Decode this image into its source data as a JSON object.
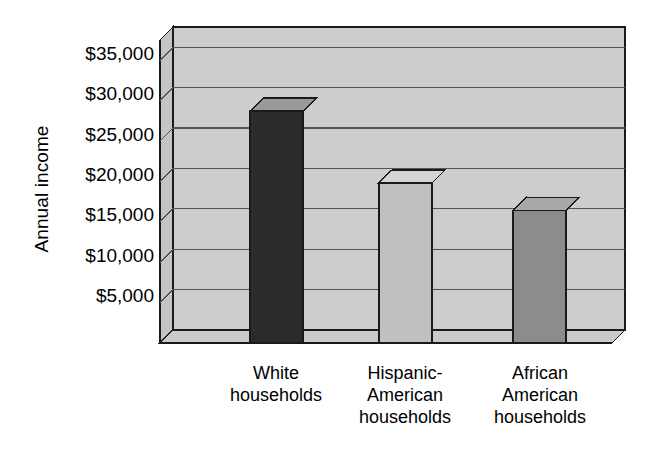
{
  "chart_data": {
    "type": "bar",
    "title": "",
    "subtitle": "",
    "xlabel": "",
    "ylabel": "Annual income",
    "categories": [
      "White\nhouseholds",
      "Hispanic-\nAmerican\nhouseholds",
      "African\nAmerican\nhouseholds"
    ],
    "values": [
      28700,
      19800,
      16400
    ],
    "value_labels": [
      "",
      "",
      ""
    ],
    "ylim": [
      0,
      37500
    ],
    "yticks": [
      5000,
      10000,
      15000,
      20000,
      25000,
      30000,
      35000
    ],
    "ytick_labels": [
      "$5,000",
      "$10,000",
      "$15,000",
      "$20,000",
      "$25,000",
      "$30,000",
      "$35,000"
    ],
    "grid": true,
    "grid_axis": "y",
    "legend": false,
    "legend_position": "none",
    "style": "3d-bar",
    "bar_colors": [
      "#2b2b2b",
      "#c0c0c0",
      "#8c8c8c"
    ],
    "bar_top_colors": [
      "#9a9a9a",
      "#d4d4d4",
      "#a8a8a8"
    ],
    "bar_side_colors": [
      "#b4b4b4",
      "#cccccc",
      "#b0b0b0"
    ],
    "series": [
      {
        "name": "Annual income",
        "values": [
          28700,
          19800,
          16400
        ]
      }
    ]
  },
  "colors": {
    "background": "#ffffff",
    "panel_back": "#cdcdcd",
    "panel_wall": "#c4c4c4",
    "panel_floor": "#c9c9c9",
    "gridline": "#545454",
    "outline": "#1a1a1a",
    "text": "#000000"
  },
  "axis": {
    "y_title": "Annual income"
  }
}
